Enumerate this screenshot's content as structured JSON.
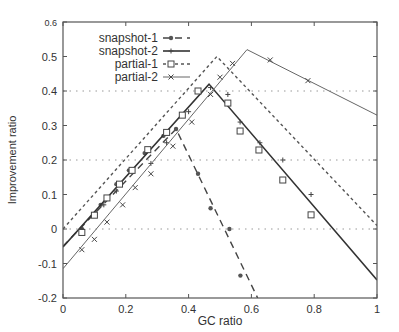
{
  "chart_data": {
    "type": "line",
    "title": "",
    "xlabel": "GC ratio",
    "ylabel": "Improvement ratio",
    "xlim": [
      0,
      1
    ],
    "ylim": [
      -0.2,
      0.6
    ],
    "xticks": [
      0,
      0.2,
      0.4,
      0.6,
      0.8,
      1
    ],
    "xtick_labels": [
      "0",
      "0.2",
      "0.4",
      "0.6",
      "0.8",
      "1"
    ],
    "yticks": [
      -0.2,
      -0.1,
      0,
      0.1,
      0.2,
      0.3,
      0.4,
      0.5,
      0.6
    ],
    "ytick_labels": [
      "-0.2",
      "-0.1",
      "0",
      "0.1",
      "0.2",
      "0.3",
      "0.4",
      "0.5",
      "0.6"
    ],
    "grid": {
      "horizontal_dotted_at": [
        0,
        0.2,
        0.4
      ]
    },
    "legend_position": "upper-left",
    "series": [
      {
        "name": "snapshot-1",
        "line_style": "long-dash",
        "marker": "filled-circle",
        "line": [
          [
            0,
            -0.05
          ],
          [
            0.36,
            0.29
          ],
          [
            0.62,
            -0.2
          ]
        ],
        "points": [
          [
            0.06,
            0.0
          ],
          [
            0.12,
            0.07
          ],
          [
            0.17,
            0.13
          ],
          [
            0.21,
            0.17
          ],
          [
            0.26,
            0.22
          ],
          [
            0.32,
            0.27
          ],
          [
            0.36,
            0.29
          ],
          [
            0.43,
            0.16
          ],
          [
            0.47,
            0.06
          ],
          [
            0.53,
            0.0
          ],
          [
            0.565,
            -0.135
          ]
        ]
      },
      {
        "name": "snapshot-2",
        "line_style": "solid-thick",
        "marker": "plus",
        "line": [
          [
            0,
            -0.052
          ],
          [
            0.465,
            0.42
          ],
          [
            1,
            -0.148
          ]
        ],
        "points": [
          [
            0.06,
            0.0
          ],
          [
            0.13,
            0.07
          ],
          [
            0.17,
            0.11
          ],
          [
            0.22,
            0.17
          ],
          [
            0.28,
            0.19
          ],
          [
            0.33,
            0.25
          ],
          [
            0.4,
            0.34
          ],
          [
            0.47,
            0.41
          ],
          [
            0.525,
            0.39
          ],
          [
            0.564,
            0.31
          ],
          [
            0.627,
            0.25
          ],
          [
            0.7,
            0.2
          ],
          [
            0.79,
            0.1
          ]
        ]
      },
      {
        "name": "partial-1",
        "line_style": "short-dash",
        "marker": "open-square",
        "line": [
          [
            0,
            0.0
          ],
          [
            0.49,
            0.5
          ],
          [
            1,
            0.01
          ]
        ],
        "points": [
          [
            0.06,
            -0.01
          ],
          [
            0.1,
            0.04
          ],
          [
            0.14,
            0.09
          ],
          [
            0.18,
            0.13
          ],
          [
            0.22,
            0.17
          ],
          [
            0.27,
            0.23
          ],
          [
            0.33,
            0.28
          ],
          [
            0.38,
            0.33
          ],
          [
            0.43,
            0.4
          ],
          [
            0.525,
            0.365
          ],
          [
            0.564,
            0.284
          ],
          [
            0.624,
            0.229
          ],
          [
            0.7,
            0.142
          ],
          [
            0.79,
            0.041
          ]
        ]
      },
      {
        "name": "partial-2",
        "line_style": "thin-solid",
        "marker": "cross",
        "line": [
          [
            0,
            -0.115
          ],
          [
            0.586,
            0.52
          ],
          [
            1,
            0.33
          ]
        ],
        "points": [
          [
            0.06,
            -0.06
          ],
          [
            0.1,
            -0.03
          ],
          [
            0.14,
            0.02
          ],
          [
            0.19,
            0.07
          ],
          [
            0.23,
            0.12
          ],
          [
            0.28,
            0.16
          ],
          [
            0.35,
            0.24
          ],
          [
            0.41,
            0.31
          ],
          [
            0.47,
            0.39
          ],
          [
            0.5,
            0.44
          ],
          [
            0.54,
            0.48
          ],
          [
            0.66,
            0.49
          ],
          [
            0.78,
            0.43
          ]
        ]
      }
    ]
  }
}
